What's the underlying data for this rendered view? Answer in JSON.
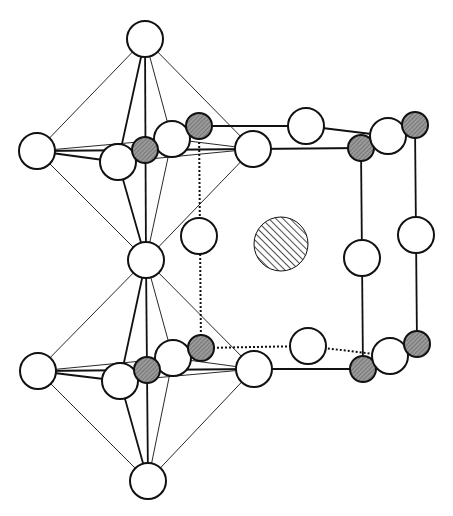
{
  "diagram": {
    "type": "crystal-structure",
    "colors": {
      "stroke": "#111111",
      "atom_open_fill": "#ffffff",
      "atom_shaded_fill": "#8a8a8a",
      "background": "#ffffff"
    },
    "atoms": [
      {
        "id": "oct1-top",
        "kind": "open",
        "x": 145,
        "y": 39,
        "r": 18
      },
      {
        "id": "oct1-left",
        "kind": "open",
        "x": 37,
        "y": 151,
        "r": 18
      },
      {
        "id": "oct1-front",
        "kind": "open",
        "x": 118,
        "y": 162,
        "r": 18
      },
      {
        "id": "oct1-back",
        "kind": "open",
        "x": 172,
        "y": 139,
        "r": 18
      },
      {
        "id": "oct1-right",
        "kind": "open",
        "x": 253,
        "y": 149,
        "r": 18
      },
      {
        "id": "oct1-center",
        "kind": "shaded",
        "x": 145,
        "y": 150,
        "r": 13
      },
      {
        "id": "oct1-shared-bottom",
        "kind": "open",
        "x": 146,
        "y": 260,
        "r": 18
      },
      {
        "id": "top-back-b",
        "kind": "shaded",
        "x": 199,
        "y": 126,
        "r": 13
      },
      {
        "id": "top-edge-mid",
        "kind": "open",
        "x": 306,
        "y": 126,
        "r": 18
      },
      {
        "id": "top-front-right-b",
        "kind": "shaded",
        "x": 361,
        "y": 148,
        "r": 13
      },
      {
        "id": "top-right-o",
        "kind": "open",
        "x": 388,
        "y": 136,
        "r": 18
      },
      {
        "id": "top-back-right-b",
        "kind": "shaded",
        "x": 415,
        "y": 125,
        "r": 13
      },
      {
        "id": "mid-left-o",
        "kind": "open",
        "x": 199,
        "y": 236,
        "r": 18
      },
      {
        "id": "center-a",
        "kind": "hatched",
        "x": 281,
        "y": 244,
        "r": 27
      },
      {
        "id": "mid-front-right-o",
        "kind": "open",
        "x": 362,
        "y": 258,
        "r": 18
      },
      {
        "id": "mid-back-right-o",
        "kind": "open",
        "x": 416,
        "y": 235,
        "r": 18
      },
      {
        "id": "oct2-left",
        "kind": "open",
        "x": 38,
        "y": 371,
        "r": 18
      },
      {
        "id": "oct2-front",
        "kind": "open",
        "x": 120,
        "y": 381,
        "r": 18
      },
      {
        "id": "oct2-back",
        "kind": "open",
        "x": 173,
        "y": 358,
        "r": 18
      },
      {
        "id": "oct2-center",
        "kind": "shaded",
        "x": 147,
        "y": 370,
        "r": 13
      },
      {
        "id": "bottom-back-b",
        "kind": "shaded",
        "x": 201,
        "y": 348,
        "r": 13
      },
      {
        "id": "oct2-right",
        "kind": "open",
        "x": 254,
        "y": 369,
        "r": 18
      },
      {
        "id": "bottom-edge-mid",
        "kind": "open",
        "x": 308,
        "y": 346,
        "r": 18
      },
      {
        "id": "bottom-front-right-b",
        "kind": "shaded",
        "x": 363,
        "y": 369,
        "r": 13
      },
      {
        "id": "bottom-right-o",
        "kind": "open",
        "x": 390,
        "y": 356,
        "r": 18
      },
      {
        "id": "bottom-back-right-b",
        "kind": "shaded",
        "x": 417,
        "y": 344,
        "r": 13
      },
      {
        "id": "oct2-bottom",
        "kind": "open",
        "x": 148,
        "y": 481,
        "r": 18
      }
    ],
    "bonds": [
      {
        "from": [
          145,
          39
        ],
        "to": [
          37,
          151
        ],
        "style": "thin"
      },
      {
        "from": [
          145,
          39
        ],
        "to": [
          118,
          162
        ],
        "style": "solid"
      },
      {
        "from": [
          145,
          39
        ],
        "to": [
          146,
          260
        ],
        "style": "solid"
      },
      {
        "from": [
          145,
          39
        ],
        "to": [
          172,
          139
        ],
        "style": "thin"
      },
      {
        "from": [
          145,
          39
        ],
        "to": [
          253,
          149
        ],
        "style": "thin"
      },
      {
        "from": [
          37,
          151
        ],
        "to": [
          146,
          260
        ],
        "style": "thin"
      },
      {
        "from": [
          118,
          162
        ],
        "to": [
          146,
          260
        ],
        "style": "solid"
      },
      {
        "from": [
          172,
          139
        ],
        "to": [
          146,
          260
        ],
        "style": "thin"
      },
      {
        "from": [
          253,
          149
        ],
        "to": [
          146,
          260
        ],
        "style": "thin"
      },
      {
        "from": [
          37,
          151
        ],
        "to": [
          253,
          149
        ],
        "style": "solid"
      },
      {
        "from": [
          37,
          151
        ],
        "to": [
          172,
          139
        ],
        "style": "thin"
      },
      {
        "from": [
          37,
          151
        ],
        "to": [
          118,
          162
        ],
        "style": "solid"
      },
      {
        "from": [
          118,
          162
        ],
        "to": [
          253,
          149
        ],
        "style": "thin"
      },
      {
        "from": [
          172,
          139
        ],
        "to": [
          253,
          149
        ],
        "style": "thin"
      },
      {
        "from": [
          199,
          126
        ],
        "to": [
          306,
          126
        ],
        "style": "solid"
      },
      {
        "from": [
          306,
          126
        ],
        "to": [
          388,
          136
        ],
        "style": "solid"
      },
      {
        "from": [
          253,
          149
        ],
        "to": [
          361,
          148
        ],
        "style": "solid"
      },
      {
        "from": [
          361,
          148
        ],
        "to": [
          388,
          136
        ],
        "style": "solid"
      },
      {
        "from": [
          388,
          136
        ],
        "to": [
          415,
          125
        ],
        "style": "solid"
      },
      {
        "from": [
          361,
          148
        ],
        "to": [
          363,
          369
        ],
        "style": "solid"
      },
      {
        "from": [
          415,
          125
        ],
        "to": [
          417,
          344
        ],
        "style": "solid"
      },
      {
        "from": [
          199,
          126
        ],
        "to": [
          201,
          348
        ],
        "style": "dotted"
      },
      {
        "from": [
          146,
          260
        ],
        "to": [
          37,
          371
        ],
        "style": "thin"
      },
      {
        "from": [
          146,
          260
        ],
        "to": [
          120,
          381
        ],
        "style": "solid"
      },
      {
        "from": [
          146,
          260
        ],
        "to": [
          148,
          481
        ],
        "style": "solid"
      },
      {
        "from": [
          146,
          260
        ],
        "to": [
          173,
          358
        ],
        "style": "thin"
      },
      {
        "from": [
          146,
          260
        ],
        "to": [
          254,
          369
        ],
        "style": "thin"
      },
      {
        "from": [
          38,
          371
        ],
        "to": [
          148,
          481
        ],
        "style": "thin"
      },
      {
        "from": [
          120,
          381
        ],
        "to": [
          148,
          481
        ],
        "style": "solid"
      },
      {
        "from": [
          173,
          358
        ],
        "to": [
          148,
          481
        ],
        "style": "thin"
      },
      {
        "from": [
          254,
          369
        ],
        "to": [
          148,
          481
        ],
        "style": "thin"
      },
      {
        "from": [
          38,
          371
        ],
        "to": [
          254,
          369
        ],
        "style": "solid"
      },
      {
        "from": [
          38,
          371
        ],
        "to": [
          173,
          358
        ],
        "style": "thin"
      },
      {
        "from": [
          38,
          371
        ],
        "to": [
          120,
          381
        ],
        "style": "solid"
      },
      {
        "from": [
          120,
          381
        ],
        "to": [
          254,
          369
        ],
        "style": "thin"
      },
      {
        "from": [
          173,
          358
        ],
        "to": [
          254,
          369
        ],
        "style": "thin"
      },
      {
        "from": [
          201,
          348
        ],
        "to": [
          308,
          346
        ],
        "style": "dotted"
      },
      {
        "from": [
          308,
          346
        ],
        "to": [
          390,
          356
        ],
        "style": "dotted"
      },
      {
        "from": [
          254,
          369
        ],
        "to": [
          363,
          369
        ],
        "style": "solid"
      },
      {
        "from": [
          363,
          369
        ],
        "to": [
          390,
          356
        ],
        "style": "solid"
      },
      {
        "from": [
          390,
          356
        ],
        "to": [
          417,
          344
        ],
        "style": "solid"
      }
    ]
  }
}
